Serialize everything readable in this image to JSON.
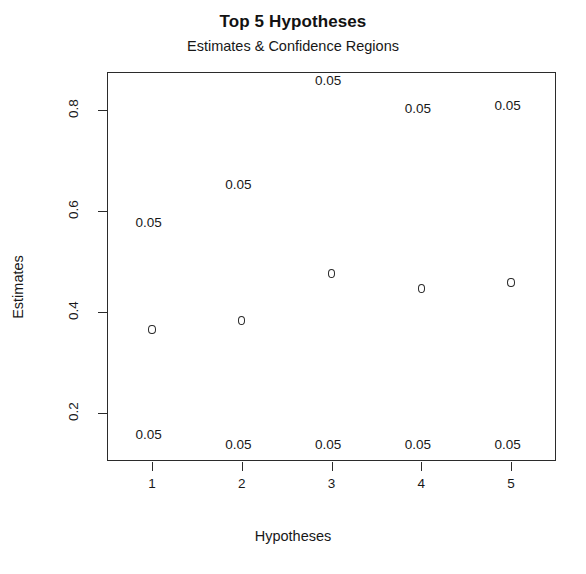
{
  "chart_data": {
    "type": "scatter",
    "title": "Top 5 Hypotheses",
    "subtitle": "Estimates & Confidence Regions",
    "xlabel": "Hypotheses",
    "ylabel": "Estimates",
    "grid": false,
    "legend": "none",
    "xlim": [
      0.5,
      5.5
    ],
    "ylim": [
      0.105,
      0.875
    ],
    "xticks": [
      "1",
      "2",
      "3",
      "4",
      "5"
    ],
    "xtick_values": [
      1,
      2,
      3,
      4,
      5
    ],
    "yticks": [
      "0.2",
      "0.4",
      "0.6",
      "0.8"
    ],
    "ytick_values": [
      0.2,
      0.4,
      0.6,
      0.8
    ],
    "categories": [
      "1",
      "2",
      "3",
      "4",
      "5"
    ],
    "x": [
      1,
      2,
      3,
      4,
      5
    ],
    "values": [
      0.365,
      0.383,
      0.476,
      0.446,
      0.458
    ],
    "series": [
      {
        "name": "Estimates",
        "marker": "open-circle",
        "values": [
          0.365,
          0.383,
          0.476,
          0.446,
          0.458
        ]
      },
      {
        "name": "Upper confidence bound labels",
        "values": [
          0.575,
          0.65,
          0.855,
          0.8,
          0.805
        ]
      },
      {
        "name": "Lower confidence bound labels",
        "values": [
          0.155,
          0.135,
          0.135,
          0.135,
          0.135
        ]
      }
    ],
    "annotations_upper": [
      {
        "x": 1,
        "y": 0.575,
        "text": "0.05"
      },
      {
        "x": 2,
        "y": 0.65,
        "text": "0.05"
      },
      {
        "x": 3,
        "y": 0.855,
        "text": "0.05"
      },
      {
        "x": 4,
        "y": 0.8,
        "text": "0.05"
      },
      {
        "x": 5,
        "y": 0.805,
        "text": "0.05"
      }
    ],
    "annotations_lower": [
      {
        "x": 1,
        "y": 0.155,
        "text": "0.05"
      },
      {
        "x": 2,
        "y": 0.135,
        "text": "0.05"
      },
      {
        "x": 3,
        "y": 0.135,
        "text": "0.05"
      },
      {
        "x": 4,
        "y": 0.135,
        "text": "0.05"
      },
      {
        "x": 5,
        "y": 0.135,
        "text": "0.05"
      }
    ],
    "colors": {
      "axis": "#2b2b2b",
      "text": "#181818",
      "marker": "#2b2b2b",
      "background": "#ffffff"
    }
  }
}
